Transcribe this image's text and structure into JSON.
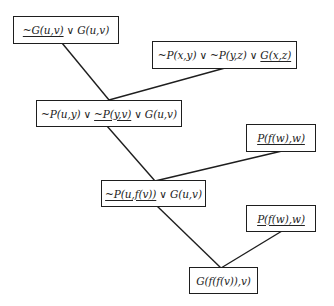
{
  "diagram": {
    "type": "resolution-refutation-tree",
    "clauses": [
      {
        "id": "c1",
        "box": {
          "x": 13,
          "y": 16,
          "w": 106,
          "h": 28
        },
        "literals": [
          {
            "text": "~G(u,v)",
            "resolved": true
          },
          {
            "text": "G(u,v)",
            "resolved": false
          }
        ]
      },
      {
        "id": "c2",
        "box": {
          "x": 152,
          "y": 41,
          "w": 145,
          "h": 28
        },
        "literals": [
          {
            "text": "~P(x,y)",
            "resolved": false
          },
          {
            "text": "~P(y,z)",
            "resolved": false
          },
          {
            "text": "G(x,z)",
            "resolved": true
          }
        ]
      },
      {
        "id": "c3",
        "box": {
          "x": 36,
          "y": 100,
          "w": 146,
          "h": 27
        },
        "literals": [
          {
            "text": "~P(u,y)",
            "resolved": false
          },
          {
            "text": "~P(y,v)",
            "resolved": true
          },
          {
            "text": "G(u,v)",
            "resolved": false
          }
        ]
      },
      {
        "id": "c4",
        "box": {
          "x": 246,
          "y": 124,
          "w": 70,
          "h": 28
        },
        "literals": [
          {
            "text": "P(f(w),w)",
            "resolved": true
          }
        ]
      },
      {
        "id": "c5",
        "box": {
          "x": 101,
          "y": 180,
          "w": 105,
          "h": 27
        },
        "literals": [
          {
            "text": "~P(u,f(v))",
            "resolved": true
          },
          {
            "text": "G(u,v)",
            "resolved": false
          }
        ]
      },
      {
        "id": "c6",
        "box": {
          "x": 246,
          "y": 205,
          "w": 70,
          "h": 27
        },
        "literals": [
          {
            "text": "P(f(w),w)",
            "resolved": true
          }
        ]
      },
      {
        "id": "c7",
        "box": {
          "x": 189,
          "y": 267,
          "w": 69,
          "h": 27
        },
        "literals": [
          {
            "text": "G(f(f(v)),v)",
            "resolved": false
          }
        ]
      }
    ],
    "or_symbol": "∨",
    "edges": [
      {
        "from": "c1",
        "to": "c3",
        "x1": 62,
        "y1": 43,
        "x2": 109,
        "y2": 100
      },
      {
        "from": "c2",
        "to": "c3",
        "x1": 225,
        "y1": 68,
        "x2": 109,
        "y2": 100
      },
      {
        "from": "c3",
        "to": "c5",
        "x1": 107,
        "y1": 126,
        "x2": 155,
        "y2": 181
      },
      {
        "from": "c4",
        "to": "c5",
        "x1": 282,
        "y1": 151,
        "x2": 155,
        "y2": 181
      },
      {
        "from": "c5",
        "to": "c7",
        "x1": 157,
        "y1": 206,
        "x2": 221,
        "y2": 268
      },
      {
        "from": "c6",
        "to": "c7",
        "x1": 282,
        "y1": 231,
        "x2": 221,
        "y2": 268
      }
    ],
    "colors": {
      "stroke": "#1e1e1e",
      "text": "#222222",
      "background": "#ffffff"
    }
  }
}
